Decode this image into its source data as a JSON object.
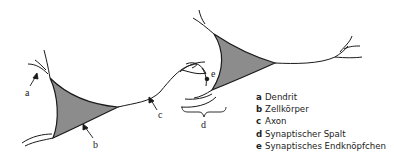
{
  "diagram": {
    "type": "neuron-synapse-illustration",
    "labels": {
      "a": "a",
      "b": "b",
      "c": "c",
      "d": "d",
      "e": "e"
    },
    "legend": [
      {
        "letter": "a",
        "text": "Dendrit"
      },
      {
        "letter": "b",
        "text": "Zellkörper"
      },
      {
        "letter": "c",
        "text": "Axon"
      },
      {
        "letter": "d",
        "text": "Synaptischer Spalt"
      },
      {
        "letter": "e",
        "text": "Synaptisches Endknöpfchen"
      }
    ],
    "colors": {
      "stroke": "#1a1a1a",
      "cell_body_fill": "#8c8c8c",
      "background": "#ffffff"
    }
  }
}
